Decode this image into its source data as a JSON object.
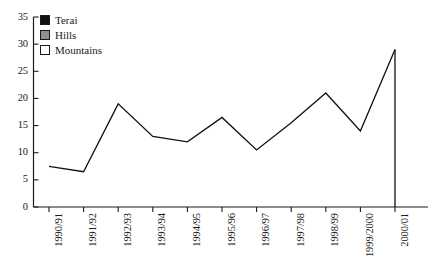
{
  "chart_data": {
    "type": "line",
    "title": "",
    "xlabel": "",
    "ylabel": "",
    "categories": [
      "1990/91",
      "1991/92",
      "1992/93",
      "1993/94",
      "1994/95",
      "1995/96",
      "1996/97",
      "1997/98",
      "1998/99",
      "1999/2000",
      "2000/01"
    ],
    "series": [
      {
        "name": "Terai",
        "color": "#111111",
        "values": [
          7.5,
          6.5,
          19,
          13,
          12,
          16.5,
          10.5,
          15.5,
          21,
          14,
          29
        ]
      }
    ],
    "ylim": [
      0,
      35
    ],
    "ytick_step": 5,
    "yticks": [
      "0",
      "5",
      "10",
      "15",
      "20",
      "25",
      "30",
      "35"
    ],
    "grid": false,
    "legend_position": "top-left",
    "legend": [
      {
        "label": "Terai",
        "swatch": "terai",
        "color": "#111111"
      },
      {
        "label": "Hills",
        "swatch": "hills",
        "color": "#8f8f8f"
      },
      {
        "label": "Mountains",
        "swatch": "mountains",
        "color": "#ffffff"
      }
    ]
  }
}
